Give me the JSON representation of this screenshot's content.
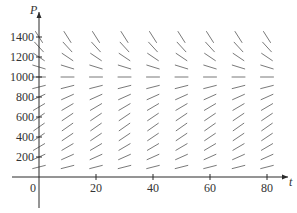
{
  "chart_data": {
    "type": "slope_field",
    "title": "",
    "xlabel": "t",
    "ylabel": "P",
    "equation_inferred": "dP/dt = k P (1 - P/1000)",
    "carrying_capacity": 1000,
    "xlim": [
      0,
      85
    ],
    "ylim": [
      0,
      1500
    ],
    "x_ticks": [
      0,
      20,
      40,
      60,
      80
    ],
    "x_tick_labels": [
      "0",
      "20",
      "40",
      "60",
      "80"
    ],
    "y_ticks": [
      200,
      400,
      600,
      800,
      1000,
      1200,
      1400
    ],
    "y_tick_labels": [
      "200",
      "400",
      "600",
      "800",
      "1000",
      "1200",
      "1400"
    ],
    "origin_label": "0",
    "grid": false,
    "legend": null,
    "field_t_values": [
      0,
      10,
      20,
      30,
      40,
      50,
      60,
      70,
      80
    ],
    "field_P_values": [
      100,
      200,
      300,
      400,
      500,
      600,
      700,
      800,
      900,
      1000,
      1100,
      1200,
      1300,
      1400
    ],
    "growth_rate_k": 0.08
  },
  "layout": {
    "origin_px": [
      39,
      177
    ],
    "px_per_t": 2.85,
    "px_per_P": 0.1,
    "x_axis_end_px": 288,
    "y_axis_top_px": 12,
    "y_axis_bottom_px": 208,
    "x_axis_left_px": 12,
    "segment_half_length_px": 6.5,
    "colors": {
      "axis": "#2a2a2a",
      "segment": "#6a6a6a",
      "text": "#333333"
    }
  }
}
